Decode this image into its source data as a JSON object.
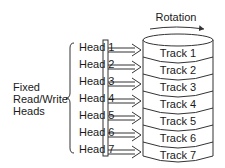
{
  "diagram": {
    "rotation_label": "Rotation",
    "group_label": {
      "line1": "Fixed",
      "line2": "Read/Write",
      "line3": "Heads"
    },
    "heads": [
      "Head 1",
      "Head 2",
      "Head 3",
      "Head 4",
      "Head 5",
      "Head 6",
      "Head 7"
    ],
    "tracks": [
      "Track 1",
      "Track 2",
      "Track 3",
      "Track 4",
      "Track 5",
      "Track 6",
      "Track 7"
    ],
    "colors": {
      "stroke": "#333333",
      "text": "#1a1a1a",
      "background": "#ffffff"
    }
  }
}
